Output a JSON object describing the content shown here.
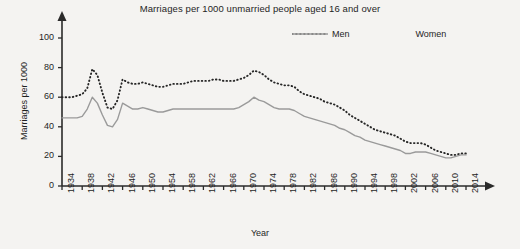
{
  "chart_data": {
    "type": "line",
    "title": "Marriages per 1000 unmarried people aged 16 and over",
    "xlabel": "Year",
    "ylabel": "Marriages per 1000",
    "xlim": [
      1934,
      2014
    ],
    "ylim": [
      0,
      100
    ],
    "yticks": [
      0,
      20,
      40,
      60,
      80,
      100
    ],
    "xticks": [
      1934,
      1938,
      1942,
      1946,
      1950,
      1954,
      1958,
      1962,
      1966,
      1970,
      1974,
      1978,
      1982,
      1986,
      1990,
      1994,
      1998,
      2002,
      2006,
      2010,
      2014
    ],
    "grid": false,
    "legend_position": "top-right",
    "x": [
      1934,
      1935,
      1936,
      1937,
      1938,
      1939,
      1940,
      1941,
      1942,
      1943,
      1944,
      1945,
      1946,
      1947,
      1948,
      1949,
      1950,
      1951,
      1952,
      1953,
      1954,
      1955,
      1956,
      1957,
      1958,
      1959,
      1960,
      1961,
      1962,
      1963,
      1964,
      1965,
      1966,
      1967,
      1968,
      1969,
      1970,
      1971,
      1972,
      1973,
      1974,
      1975,
      1976,
      1977,
      1978,
      1979,
      1980,
      1981,
      1982,
      1983,
      1984,
      1985,
      1986,
      1987,
      1988,
      1989,
      1990,
      1991,
      1992,
      1993,
      1994,
      1995,
      1996,
      1997,
      1998,
      1999,
      2000,
      2001,
      2002,
      2003,
      2004,
      2005,
      2006,
      2007,
      2008,
      2009,
      2010,
      2011,
      2012,
      2013,
      2014
    ],
    "series": [
      {
        "name": "Men",
        "style": "dotted",
        "color": "#262626",
        "values": [
          60,
          60,
          60,
          61,
          62,
          66,
          79,
          75,
          63,
          53,
          52,
          58,
          72,
          70,
          69,
          69,
          70,
          69,
          68,
          67,
          67,
          68,
          69,
          69,
          69,
          70,
          71,
          71,
          71,
          71,
          72,
          72,
          71,
          71,
          71,
          72,
          73,
          75,
          78,
          77,
          75,
          72,
          70,
          69,
          68,
          68,
          67,
          64,
          62,
          61,
          60,
          59,
          57,
          56,
          55,
          53,
          51,
          48,
          46,
          44,
          42,
          40,
          38,
          37,
          36,
          35,
          34,
          32,
          30,
          29,
          29,
          29,
          28,
          26,
          24,
          23,
          22,
          21,
          21,
          22,
          22
        ]
      },
      {
        "name": "Women",
        "style": "solid",
        "color": "#9a9a9a",
        "values": [
          46,
          46,
          46,
          46,
          47,
          52,
          60,
          56,
          48,
          41,
          40,
          45,
          56,
          54,
          52,
          52,
          53,
          52,
          51,
          50,
          50,
          51,
          52,
          52,
          52,
          52,
          52,
          52,
          52,
          52,
          52,
          52,
          52,
          52,
          52,
          53,
          55,
          57,
          60,
          58,
          57,
          55,
          53,
          52,
          52,
          52,
          51,
          49,
          47,
          46,
          45,
          44,
          43,
          42,
          41,
          39,
          38,
          36,
          34,
          33,
          31,
          30,
          29,
          28,
          27,
          26,
          25,
          24,
          22,
          22,
          23,
          23,
          23,
          22,
          21,
          20,
          19,
          19,
          20,
          21,
          21
        ]
      }
    ]
  },
  "axis": {
    "y_tick_labels": [
      "0",
      "20",
      "40",
      "60",
      "80",
      "100"
    ],
    "x_tick_labels": [
      "1934",
      "1938",
      "1942",
      "1946",
      "1950",
      "1954",
      "1958",
      "1962",
      "1966",
      "1970",
      "1974",
      "1978",
      "1982",
      "1986",
      "1990",
      "1994",
      "1998",
      "2002",
      "2006",
      "2010",
      "2014"
    ]
  },
  "legend": {
    "items": [
      {
        "label": "Men",
        "swatch": "dotted-line-swatch"
      },
      {
        "label": "Women",
        "swatch": "solid-line-swatch"
      }
    ]
  },
  "colors": {
    "background": "#f4f3f1",
    "men": "#262626",
    "women": "#9a9a9a",
    "axis": "#2a2a2a"
  }
}
